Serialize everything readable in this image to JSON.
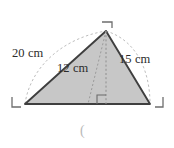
{
  "figure": {
    "type": "triangle-diagram",
    "colors": {
      "fill": "#c7c7c7",
      "stroke": "#3f3f3f",
      "dashed": "#b0b0b0",
      "corner_mark": "#6e6e6e",
      "text": "#2b2b2b",
      "caption": "#b9b9b9",
      "background": "#ffffff"
    },
    "vertices": {
      "apex": {
        "label": "apex-vertex",
        "x": 106,
        "y": 31
      },
      "bottom_left": {
        "label": "bottom-left-vertex",
        "x": 25,
        "y": 104
      },
      "bottom_right": {
        "label": "bottom-right-vertex",
        "x": 150,
        "y": 104
      },
      "height_foot": {
        "label": "height-foot",
        "x": 106,
        "y": 104
      }
    },
    "labels": {
      "left_side": "20 cm",
      "height": "12 cm",
      "right_side": "15 cm"
    },
    "corner_marks": [
      {
        "name": "apex-corner-mark",
        "orientation": "top-right"
      },
      {
        "name": "bottom-left-corner-mark",
        "orientation": "bottom-left"
      },
      {
        "name": "bottom-right-corner-mark",
        "orientation": "bottom-right"
      }
    ],
    "right_angle_mark": {
      "name": "right-angle-mark",
      "at": "height-foot",
      "size": 9
    },
    "caption": "("
  }
}
